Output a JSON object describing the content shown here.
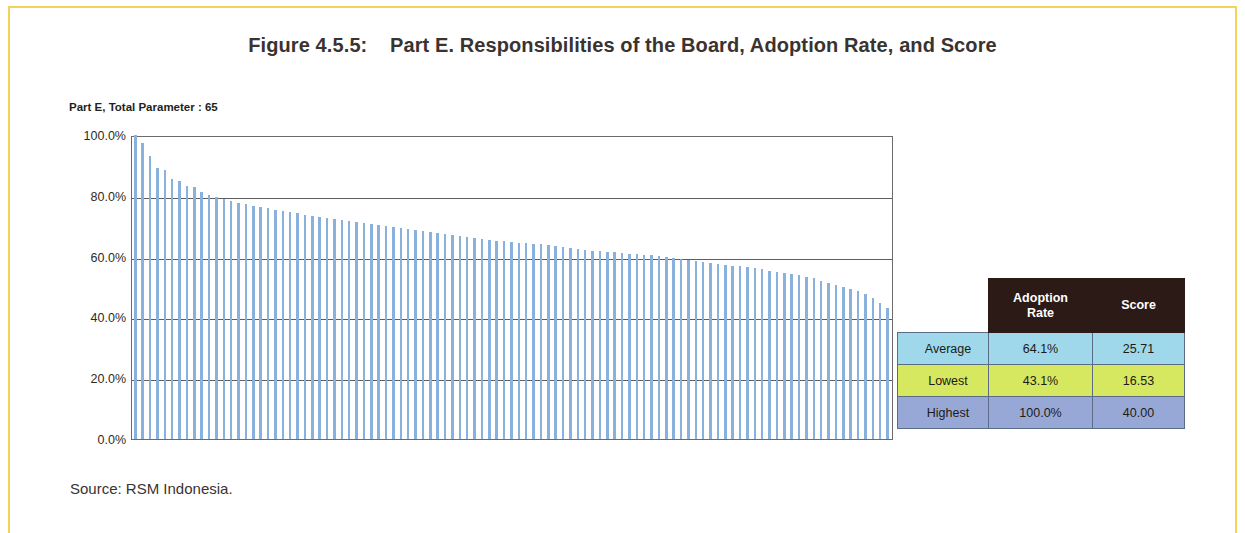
{
  "figure": {
    "title": "Figure 4.5.5:    Part E. Responsibilities of the Board, Adoption Rate, and Score",
    "source": "Source: RSM Indonesia."
  },
  "stats_table": {
    "headers": [
      "",
      "Adoption\nRate",
      "Score"
    ],
    "header_adoption_rate": "Adoption Rate",
    "header_score": "Score",
    "rows": [
      {
        "label": "Average",
        "adoption_rate": "64.1%",
        "score": "25.71"
      },
      {
        "label": "Lowest",
        "adoption_rate": "43.1%",
        "score": "16.53"
      },
      {
        "label": "Highest",
        "adoption_rate": "100.0%",
        "score": "40.00"
      }
    ],
    "colors": {
      "header_bg": "#2b1a16",
      "average_bg": "#9ed8ea",
      "lowest_bg": "#d6e85f",
      "highest_bg": "#98a8d6"
    }
  },
  "chart_data": {
    "type": "bar",
    "title": "Part E, Total Parameter : 65",
    "subtitle": "Part E, Total Parameter : 65",
    "xlabel": "",
    "ylabel": "",
    "ylim": [
      0,
      100
    ],
    "ytick_labels": [
      "100.0%",
      "80.0%",
      "60.0%",
      "40.0%",
      "20.0%",
      "0.0%"
    ],
    "ytick_values": [
      100,
      80,
      60,
      40,
      20,
      0
    ],
    "grid": true,
    "legend": "none",
    "bar_color": "#8ab0dc",
    "unit": "percent",
    "series_name": "Adoption Rate",
    "n_bars": 103,
    "values": [
      100.0,
      97.4,
      93.2,
      89.2,
      88.5,
      85.4,
      85.0,
      83.1,
      82.8,
      81.2,
      80.3,
      79.5,
      78.9,
      78.3,
      77.8,
      77.2,
      76.8,
      76.3,
      75.9,
      75.4,
      75.0,
      74.6,
      74.2,
      73.8,
      73.5,
      73.1,
      72.8,
      72.4,
      72.0,
      71.7,
      71.3,
      71.0,
      70.6,
      70.3,
      70.0,
      69.7,
      69.4,
      69.1,
      68.8,
      68.5,
      68.2,
      67.9,
      67.5,
      67.2,
      66.9,
      66.5,
      66.2,
      65.9,
      65.5,
      65.2,
      65.0,
      64.8,
      64.6,
      64.4,
      64.2,
      64.0,
      63.7,
      63.4,
      63.1,
      62.8,
      62.5,
      62.2,
      62.0,
      61.8,
      61.6,
      61.4,
      61.2,
      61.0,
      60.8,
      60.6,
      60.4,
      60.2,
      60.0,
      59.5,
      59.1,
      58.8,
      58.5,
      58.2,
      57.9,
      57.6,
      57.3,
      57.0,
      56.8,
      56.5,
      56.2,
      55.8,
      55.4,
      55.0,
      54.6,
      54.2,
      53.8,
      53.4,
      53.0,
      52.0,
      51.2,
      50.6,
      50.0,
      49.4,
      48.6,
      47.6,
      46.4,
      44.8,
      43.1
    ],
    "summary": {
      "average": 64.1,
      "lowest": 43.1,
      "highest": 100.0
    }
  }
}
